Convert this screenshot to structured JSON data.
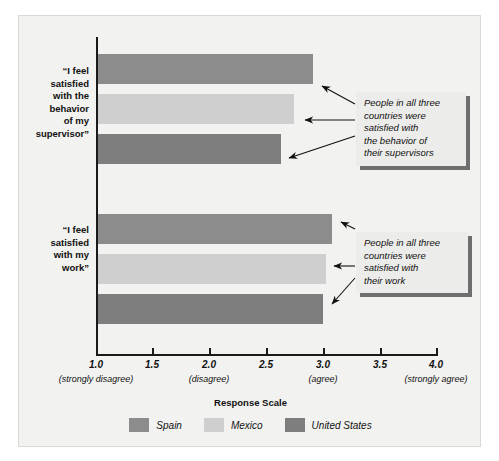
{
  "chart_data": {
    "type": "bar",
    "orientation": "horizontal",
    "title": "",
    "xlabel": "Response Scale",
    "ylabel": "",
    "xlim": [
      1.0,
      4.0
    ],
    "grid": false,
    "legend_position": "bottom",
    "categories": [
      "\"I feel satisfied with the behavior of my supervisor\"",
      "\"I feel satisfied with my work\""
    ],
    "series": [
      {
        "name": "Spain",
        "color": "#8c8c8c",
        "values": [
          2.91,
          3.08
        ]
      },
      {
        "name": "Mexico",
        "color": "#cfcfcf",
        "values": [
          2.74,
          3.02
        ]
      },
      {
        "name": "United States",
        "color": "#7e7e7e",
        "values": [
          2.62,
          3.0
        ]
      }
    ],
    "xticks": [
      1.0,
      1.5,
      2.0,
      2.5,
      3.0,
      3.5,
      4.0
    ],
    "xtick_labels": [
      "1.0",
      "1.5",
      "2.0",
      "2.5",
      "3.0",
      "3.5",
      "4.0"
    ],
    "xtick_sublabels": [
      "(strongly disagree)",
      "",
      "(disagree)",
      "",
      "(agree)",
      "",
      "(strongly agree)"
    ],
    "annotations": [
      "People in all three countries were satisfied with the behavior of their supervisors",
      "People in all three countries were satisfied with their work"
    ]
  },
  "category_labels": [
    {
      "lines": [
        "“I feel",
        "satisfied",
        "with the",
        "behavior",
        "of my",
        "supervisor”"
      ]
    },
    {
      "lines": [
        "“I feel",
        "satisfied",
        "with my",
        "work”"
      ]
    }
  ],
  "axis": {
    "title": "Response Scale",
    "ticks": [
      {
        "label": "1.0",
        "sub": "(strongly disagree)"
      },
      {
        "label": "1.5",
        "sub": ""
      },
      {
        "label": "2.0",
        "sub": "(disagree)"
      },
      {
        "label": "2.5",
        "sub": ""
      },
      {
        "label": "3.0",
        "sub": "(agree)"
      },
      {
        "label": "3.5",
        "sub": ""
      },
      {
        "label": "4.0",
        "sub": "(strongly agree)"
      }
    ]
  },
  "callouts": [
    {
      "lines": [
        "People in all three",
        "countries were",
        "satisfied with",
        "the behavior of",
        "their supervisors"
      ]
    },
    {
      "lines": [
        "People in all three",
        "countries were",
        "satisfied with",
        "their work"
      ]
    }
  ],
  "legend": {
    "items": [
      {
        "label": "Spain",
        "color": "#8c8c8c"
      },
      {
        "label": "Mexico",
        "color": "#cfcfcf"
      },
      {
        "label": "United States",
        "color": "#7e7e7e"
      }
    ]
  },
  "colors": {
    "spain": "#8c8c8c",
    "mexico": "#cfcfcf",
    "united_states": "#7e7e7e",
    "panel_background": "#f2f2f0",
    "axis": "#1a1a1a",
    "callout_background": "#ececea",
    "callout_shadow": "#6e6e6e"
  }
}
